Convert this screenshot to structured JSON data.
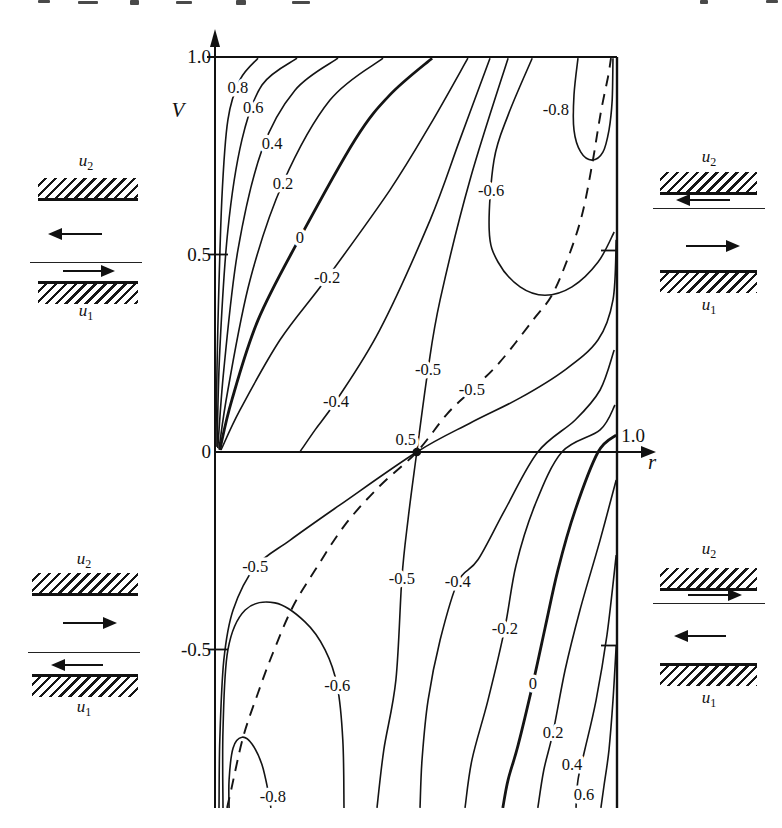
{
  "chart_data": {
    "type": "contour",
    "title": "",
    "xlabel": "r",
    "ylabel": "V",
    "xlim": [
      0,
      1
    ],
    "ylim": [
      -0.95,
      1
    ],
    "grid": false,
    "legend": "none",
    "line_color": "#141414",
    "levels": [
      -0.8,
      -0.6,
      -0.5,
      -0.4,
      -0.2,
      0,
      0.2,
      0.4,
      0.6,
      0.8
    ],
    "x_ticks": [
      {
        "value": 1.0,
        "label": "1.0"
      }
    ],
    "y_ticks": [
      {
        "value": 1.0,
        "label": "1.0"
      },
      {
        "value": 0.5,
        "label": "0.5"
      },
      {
        "value": 0.0,
        "label": "0"
      },
      {
        "value": -0.5,
        "label": "-0.5"
      }
    ],
    "right_edge_ticks": [
      0.5,
      -0.5
    ],
    "saddle_point": {
      "r": 0.502,
      "V": 0.0,
      "label": "0.5"
    },
    "contours": [
      {
        "level": "0.8",
        "style": "solid",
        "weight": "normal",
        "points": [
          [
            0.002,
            0.015
          ],
          [
            0.007,
            0.309
          ],
          [
            0.017,
            0.638
          ],
          [
            0.032,
            0.841
          ],
          [
            0.062,
            0.942
          ],
          [
            0.107,
            0.997
          ]
        ],
        "label": {
          "text": "0.8",
          "r": 0.057,
          "V": 0.922
        }
      },
      {
        "level": "0.6",
        "style": "solid",
        "weight": "normal",
        "points": [
          [
            0.005,
            0.013
          ],
          [
            0.012,
            0.258
          ],
          [
            0.032,
            0.562
          ],
          [
            0.067,
            0.79
          ],
          [
            0.117,
            0.929
          ],
          [
            0.204,
            0.997
          ]
        ],
        "label": {
          "text": "0.6",
          "r": 0.095,
          "V": 0.871
        }
      },
      {
        "level": "0.4",
        "style": "solid",
        "weight": "normal",
        "points": [
          [
            0.007,
            0.01
          ],
          [
            0.022,
            0.208
          ],
          [
            0.057,
            0.511
          ],
          [
            0.117,
            0.765
          ],
          [
            0.199,
            0.916
          ],
          [
            0.306,
            0.997
          ]
        ],
        "label": {
          "text": "0.4",
          "r": 0.142,
          "V": 0.782
        }
      },
      {
        "level": "0.2",
        "style": "solid",
        "weight": "normal",
        "points": [
          [
            0.01,
            0.008
          ],
          [
            0.032,
            0.157
          ],
          [
            0.087,
            0.435
          ],
          [
            0.169,
            0.681
          ],
          [
            0.286,
            0.891
          ],
          [
            0.418,
            0.997
          ]
        ],
        "label": {
          "text": "0.2",
          "r": 0.169,
          "V": 0.681
        }
      },
      {
        "level": "0",
        "style": "solid",
        "weight": "bold",
        "points": [
          [
            0.012,
            0.005
          ],
          [
            0.042,
            0.132
          ],
          [
            0.107,
            0.334
          ],
          [
            0.211,
            0.542
          ],
          [
            0.348,
            0.79
          ],
          [
            0.435,
            0.904
          ],
          [
            0.54,
            0.997
          ]
        ],
        "label": {
          "text": "0",
          "r": 0.211,
          "V": 0.542
        }
      },
      {
        "level": "-0.2",
        "style": "solid",
        "weight": "normal",
        "points": [
          [
            0.015,
            0.005
          ],
          [
            0.062,
            0.106
          ],
          [
            0.162,
            0.284
          ],
          [
            0.279,
            0.441
          ],
          [
            0.435,
            0.663
          ],
          [
            0.535,
            0.828
          ],
          [
            0.629,
            0.997
          ]
        ],
        "label": {
          "text": "-0.2",
          "r": 0.279,
          "V": 0.441
        }
      },
      {
        "level": "-0.4",
        "style": "solid",
        "weight": "normal",
        "points": [
          [
            0.211,
            0.0
          ],
          [
            0.249,
            0.056
          ],
          [
            0.301,
            0.129
          ],
          [
            0.41,
            0.309
          ],
          [
            0.535,
            0.587
          ],
          [
            0.609,
            0.79
          ],
          [
            0.684,
            0.997
          ]
        ],
        "label": {
          "text": "-0.4",
          "r": 0.301,
          "V": 0.129
        }
      },
      {
        "level": "-0.5",
        "style": "solid",
        "weight": "normal",
        "points": [
          [
            0.729,
            0.997
          ],
          [
            0.634,
            0.688
          ],
          [
            0.56,
            0.385
          ],
          [
            0.53,
            0.21
          ],
          [
            0.502,
            0.0
          ],
          [
            0.48,
            -0.172
          ],
          [
            0.465,
            -0.319
          ],
          [
            0.45,
            -0.577
          ],
          [
            0.42,
            -0.754
          ],
          [
            0.403,
            -0.901
          ]
        ],
        "label": {
          "text": "-0.5",
          "r": 0.53,
          "V": 0.21
        },
        "label2": {
          "text": "-0.5",
          "r": 0.465,
          "V": -0.319
        }
      },
      {
        "level": "-0.5",
        "style": "solid",
        "weight": "normal",
        "points": [
          [
            0.01,
            -0.901
          ],
          [
            0.012,
            -0.729
          ],
          [
            0.022,
            -0.527
          ],
          [
            0.045,
            -0.4
          ],
          [
            0.1,
            -0.291
          ],
          [
            0.187,
            -0.223
          ],
          [
            0.311,
            -0.134
          ],
          [
            0.502,
            0.0
          ],
          [
            0.634,
            0.073
          ],
          [
            0.759,
            0.137
          ],
          [
            0.871,
            0.208
          ],
          [
            0.953,
            0.284
          ],
          [
            0.99,
            0.385
          ],
          [
            0.998,
            0.537
          ]
        ],
        "label": {
          "text": "-0.5",
          "r": 0.1,
          "V": -0.291
        }
      },
      {
        "level": "-0.6",
        "style": "solid",
        "weight": "normal",
        "points": [
          [
            0.789,
            0.997
          ],
          [
            0.729,
            0.853
          ],
          [
            0.694,
            0.739
          ],
          [
            0.682,
            0.562
          ],
          [
            0.704,
            0.481
          ],
          [
            0.759,
            0.418
          ],
          [
            0.821,
            0.397
          ],
          [
            0.888,
            0.418
          ],
          [
            0.953,
            0.481
          ],
          [
            0.993,
            0.557
          ]
        ],
        "label": {
          "text": "-0.6",
          "r": 0.687,
          "V": 0.661
        }
      },
      {
        "level": "-0.8",
        "style": "solid",
        "weight": "normal",
        "points": [
          [
            0.903,
            0.997
          ],
          [
            0.893,
            0.904
          ],
          [
            0.893,
            0.815
          ],
          [
            0.91,
            0.759
          ],
          [
            0.938,
            0.739
          ],
          [
            0.965,
            0.759
          ],
          [
            0.98,
            0.815
          ],
          [
            0.988,
            0.891
          ],
          [
            0.99,
            0.997
          ]
        ],
        "label": {
          "text": "-0.8",
          "r": 0.848,
          "V": 0.866
        }
      },
      {
        "level": "-0.6",
        "style": "solid",
        "weight": "normal",
        "points": [
          [
            0.02,
            -0.901
          ],
          [
            0.02,
            -0.704
          ],
          [
            0.032,
            -0.501
          ],
          [
            0.075,
            -0.4
          ],
          [
            0.149,
            -0.382
          ],
          [
            0.224,
            -0.43
          ],
          [
            0.274,
            -0.501
          ],
          [
            0.304,
            -0.592
          ],
          [
            0.318,
            -0.729
          ],
          [
            0.321,
            -0.901
          ]
        ],
        "label": {
          "text": "-0.6",
          "r": 0.304,
          "V": -0.592
        }
      },
      {
        "level": "-0.8",
        "style": "solid",
        "weight": "normal",
        "points": [
          [
            0.035,
            -0.901
          ],
          [
            0.035,
            -0.83
          ],
          [
            0.045,
            -0.749
          ],
          [
            0.067,
            -0.722
          ],
          [
            0.092,
            -0.739
          ],
          [
            0.117,
            -0.792
          ],
          [
            0.134,
            -0.868
          ],
          [
            0.139,
            -0.901
          ]
        ],
        "label": {
          "text": "-0.8",
          "r": 0.144,
          "V": -0.873
        }
      },
      {
        "level": "-0.4",
        "style": "solid",
        "weight": "normal",
        "points": [
          [
            0.993,
            0.258
          ],
          [
            0.958,
            0.157
          ],
          [
            0.896,
            0.081
          ],
          [
            0.803,
            0.0
          ],
          [
            0.721,
            -0.147
          ],
          [
            0.654,
            -0.273
          ],
          [
            0.604,
            -0.329
          ],
          [
            0.56,
            -0.476
          ],
          [
            0.53,
            -0.628
          ],
          [
            0.515,
            -0.78
          ],
          [
            0.51,
            -0.901
          ]
        ],
        "label": {
          "text": "-0.4",
          "r": 0.604,
          "V": -0.329
        }
      },
      {
        "level": "-0.2",
        "style": "solid",
        "weight": "normal",
        "points": [
          [
            0.995,
            0.119
          ],
          [
            0.958,
            0.056
          ],
          [
            0.863,
            0.0
          ],
          [
            0.796,
            -0.134
          ],
          [
            0.749,
            -0.286
          ],
          [
            0.721,
            -0.446
          ],
          [
            0.679,
            -0.628
          ],
          [
            0.639,
            -0.78
          ],
          [
            0.622,
            -0.901
          ]
        ],
        "label": {
          "text": "-0.2",
          "r": 0.721,
          "V": -0.446
        }
      },
      {
        "level": "0",
        "style": "solid",
        "weight": "bold",
        "points": [
          [
            0.998,
            0.043
          ],
          [
            0.953,
            0.0
          ],
          [
            0.896,
            -0.147
          ],
          [
            0.853,
            -0.299
          ],
          [
            0.821,
            -0.446
          ],
          [
            0.791,
            -0.585
          ],
          [
            0.754,
            -0.742
          ],
          [
            0.729,
            -0.83
          ],
          [
            0.716,
            -0.901
          ]
        ],
        "label": {
          "text": "0",
          "r": 0.791,
          "V": -0.585
        }
      },
      {
        "level": "0.2",
        "style": "solid",
        "weight": "normal",
        "points": [
          [
            0.998,
            -0.071
          ],
          [
            0.958,
            -0.223
          ],
          [
            0.908,
            -0.4
          ],
          [
            0.871,
            -0.552
          ],
          [
            0.841,
            -0.709
          ],
          [
            0.818,
            -0.805
          ],
          [
            0.803,
            -0.901
          ]
        ],
        "label": {
          "text": "0.2",
          "r": 0.841,
          "V": -0.709
        }
      },
      {
        "level": "0.4",
        "style": "solid",
        "weight": "normal",
        "points": [
          [
            0.998,
            -0.261
          ],
          [
            0.975,
            -0.463
          ],
          [
            0.948,
            -0.628
          ],
          [
            0.92,
            -0.754
          ],
          [
            0.903,
            -0.83
          ],
          [
            0.898,
            -0.901
          ]
        ],
        "label": {
          "text": "0.4",
          "r": 0.888,
          "V": -0.79
        }
      },
      {
        "level": "0.6",
        "style": "solid",
        "weight": "normal",
        "points": [
          [
            0.998,
            -0.489
          ],
          [
            0.99,
            -0.628
          ],
          [
            0.98,
            -0.754
          ],
          [
            0.968,
            -0.843
          ],
          [
            0.96,
            -0.901
          ]
        ],
        "label": {
          "text": "0.6",
          "r": 0.918,
          "V": -0.866
        }
      },
      {
        "level": "-0.5",
        "style": "dashed",
        "weight": "normal",
        "points": [
          [
            0.03,
            -0.901
          ],
          [
            0.04,
            -0.856
          ],
          [
            0.07,
            -0.722
          ],
          [
            0.107,
            -0.61
          ],
          [
            0.142,
            -0.514
          ],
          [
            0.192,
            -0.395
          ],
          [
            0.249,
            -0.299
          ],
          [
            0.323,
            -0.185
          ],
          [
            0.41,
            -0.086
          ],
          [
            0.502,
            0.0
          ],
          [
            0.577,
            0.096
          ],
          [
            0.639,
            0.157
          ],
          [
            0.709,
            0.228
          ],
          [
            0.791,
            0.334
          ],
          [
            0.838,
            0.397
          ],
          [
            0.878,
            0.491
          ],
          [
            0.913,
            0.6
          ],
          [
            0.938,
            0.727
          ],
          [
            0.96,
            0.861
          ],
          [
            0.978,
            0.952
          ],
          [
            0.985,
            0.997
          ]
        ],
        "label": {
          "text": "-0.5",
          "r": 0.639,
          "V": 0.157
        }
      }
    ]
  },
  "insets": {
    "top_left": {
      "upper_wall_label": {
        "base": "u",
        "sub": "2"
      },
      "lower_wall_label": {
        "base": "u",
        "sub": "1"
      },
      "upper_arrow": "left",
      "lower_arrow": "right",
      "interface": "near-bottom"
    },
    "top_right": {
      "upper_wall_label": {
        "base": "u",
        "sub": "2"
      },
      "lower_wall_label": {
        "base": "u",
        "sub": "1"
      },
      "upper_arrow": "left",
      "lower_arrow": "right",
      "interface": "near-top"
    },
    "bottom_left": {
      "upper_wall_label": {
        "base": "u",
        "sub": "2"
      },
      "lower_wall_label": {
        "base": "u",
        "sub": "1"
      },
      "upper_arrow": "right",
      "lower_arrow": "left",
      "interface": "near-bottom"
    },
    "bottom_right": {
      "upper_wall_label": {
        "base": "u",
        "sub": "2"
      },
      "lower_wall_label": {
        "base": "u",
        "sub": "1"
      },
      "upper_arrow": "right",
      "lower_arrow": "left",
      "interface": "near-top"
    }
  }
}
